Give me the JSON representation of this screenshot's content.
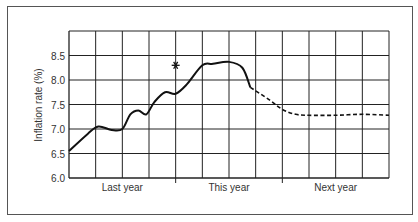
{
  "chart_data": {
    "type": "line",
    "title": "",
    "xlabel": "",
    "ylabel": "Inflation rate (%)",
    "ylim": [
      6.0,
      9.0
    ],
    "yticks": [
      "6.0",
      "6.5",
      "7.0",
      "7.5",
      "8.0",
      "8.5"
    ],
    "x_groups": [
      "Last year",
      "This year",
      "Next year"
    ],
    "x_divisions": 12,
    "grid": true,
    "legend": null,
    "series": [
      {
        "name": "Actual",
        "style": "solid",
        "x": [
          0,
          0.7,
          1.1,
          1.6,
          2.0,
          2.3,
          2.6,
          2.9,
          3.2,
          3.6,
          4.0,
          4.4,
          5.0,
          5.4,
          6.0,
          6.5,
          6.8
        ],
        "values": [
          6.55,
          6.9,
          7.05,
          6.98,
          7.0,
          7.3,
          7.38,
          7.3,
          7.55,
          7.75,
          7.72,
          7.9,
          8.3,
          8.33,
          8.37,
          8.25,
          7.85
        ]
      },
      {
        "name": "Forecast",
        "style": "dashed",
        "x": [
          6.8,
          7.5,
          8.0,
          8.5,
          9.0,
          10.0,
          11.0,
          12.0
        ],
        "values": [
          7.85,
          7.6,
          7.4,
          7.3,
          7.28,
          7.28,
          7.3,
          7.28
        ]
      }
    ],
    "annotations": [
      {
        "type": "star-marker",
        "x": 4.0,
        "y": 8.3,
        "label": ""
      }
    ]
  }
}
